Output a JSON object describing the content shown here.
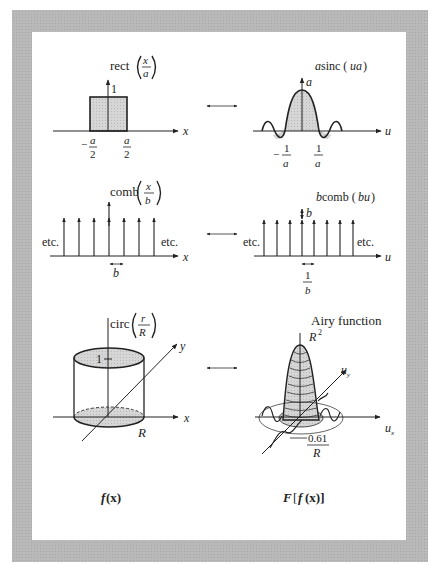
{
  "figure": {
    "left_column_label_f": "f",
    "left_column_label_arg": "(x)",
    "right_column_label_F": "F",
    "right_column_label_open": "[",
    "right_column_label_f": "f",
    "right_column_label_arg": "(x)]"
  },
  "pairs": [
    {
      "left": {
        "func": "rect",
        "arg_num": "x",
        "arg_den": "a",
        "height_label": "1",
        "tick_left_sign": "−",
        "tick_left_num": "a",
        "tick_left_den": "2",
        "tick_right_num": "a",
        "tick_right_den": "2",
        "axis_label": "x"
      },
      "right": {
        "title_a": "a",
        "title_func": " sinc (",
        "title_arg": "ua",
        "title_close": ")",
        "peak_label": "a",
        "tick_left_sign": "−",
        "tick_left_num": "1",
        "tick_left_den": "a",
        "tick_right_num": "1",
        "tick_right_den": "a",
        "axis_label": "u"
      }
    },
    {
      "left": {
        "func": "comb",
        "arg_num": "x",
        "arg_den": "b",
        "etc_left": "etc.",
        "etc_right": "etc.",
        "spacing_label": "b",
        "axis_label": "x"
      },
      "right": {
        "title_b": "b",
        "title_func": " comb (",
        "title_arg": "bu",
        "title_close": ")",
        "height_label": "b",
        "etc_left": "etc.",
        "etc_right": "etc.",
        "spacing_num": "1",
        "spacing_den": "b",
        "axis_label": "u"
      }
    },
    {
      "left": {
        "func": "circ",
        "arg_num": "r",
        "arg_den": "R",
        "height_label": "1",
        "radius_label": "R",
        "axis_x": "x",
        "axis_y": "y"
      },
      "right": {
        "title": "Airy function",
        "peak_label": "R",
        "peak_sup": "2",
        "radius_num": "0.61",
        "radius_den": "R",
        "axis_ux": "u",
        "axis_ux_sub": "x",
        "axis_uy": "u",
        "axis_uy_sub": "y"
      }
    }
  ],
  "colors": {
    "frame": "#b9b9b9",
    "fill": "#d4d4d4",
    "ink": "#222222"
  }
}
